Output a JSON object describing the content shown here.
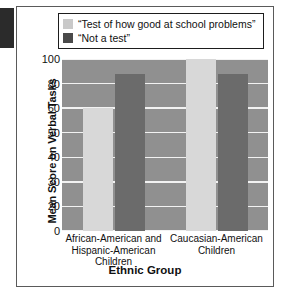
{
  "figure": {
    "legend_items": [
      {
        "label": "“Test of how good at school problems”",
        "swatch": "light",
        "color": "#c9c9c9"
      },
      {
        "label": "“Not a test”",
        "swatch": "dark",
        "color": "#4a4a4a"
      }
    ],
    "colors": {
      "plot_background": "#909090",
      "gridline": "#f2f2f2",
      "light_bar": "#d8d8d8",
      "dark_bar": "#6b6b6b",
      "text": "#111111",
      "border": "#5a5a5a"
    }
  },
  "chart_data": {
    "type": "bar",
    "title": "",
    "xlabel": "Ethnic Group",
    "ylabel": "Mean Score on Verbal Tasks",
    "categories": [
      "African-American and Hispanic-American Children",
      "Caucasian-American Children"
    ],
    "category_lines": [
      [
        "African-American and",
        "Hispanic-American",
        "Children"
      ],
      [
        "Caucasian-American",
        "Children"
      ]
    ],
    "series": [
      {
        "name": "“Test of how good at school problems”",
        "values": [
          60,
          103
        ],
        "color": "#d8d8d8"
      },
      {
        "name": "“Not a test”",
        "values": [
          88,
          88
        ],
        "color": "#6b6b6b"
      }
    ],
    "ytick_labels": [
      "0",
      "20",
      "30",
      "40",
      "50",
      "60",
      "80",
      "100"
    ],
    "ytick_values": [
      0,
      20,
      30,
      40,
      50,
      60,
      80,
      100
    ],
    "ylim": [
      0,
      105
    ],
    "axis_scale": "ordinal-ticks-evenly-spaced",
    "grid": true,
    "legend_position": "top"
  }
}
